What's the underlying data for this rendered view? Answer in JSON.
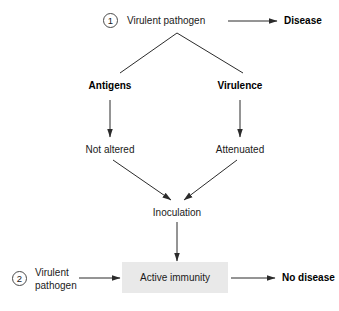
{
  "diagram": {
    "background_color": "#ffffff",
    "line_color": "#2b2b2b",
    "highlight_box_color": "#e9e9e9",
    "pathway1": {
      "marker": "1",
      "source_label": "Virulent pathogen",
      "outcome_label": "Disease",
      "branch_left_label": "Antigens",
      "branch_right_label": "Virulence",
      "branch_left_state": "Not altered",
      "branch_right_state": "Attenuated"
    },
    "middle": {
      "inoculation_label": "Inoculation"
    },
    "pathway2": {
      "marker": "2",
      "source_label": "Virulent pathogen",
      "result_label": "Active immunity",
      "outcome_label": "No disease"
    }
  }
}
